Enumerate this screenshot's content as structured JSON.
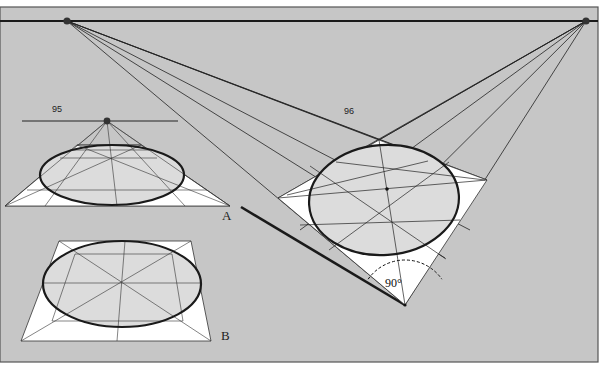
{
  "colors": {
    "background": "#c6c6c6",
    "frame": "#555555",
    "ink": "#1a1a1a",
    "plane_fill": "#ffffff",
    "ellipse_fill": "#dcdcdc",
    "thin_line": "#333333"
  },
  "frame": {
    "x": 0,
    "y": 7,
    "w": 598,
    "h": 355
  },
  "horizon": {
    "y": 21,
    "x1": 0,
    "x2": 598
  },
  "vanishing_points": [
    {
      "id": "vp-left",
      "x": 67,
      "y": 21
    },
    {
      "id": "vp-right",
      "x": 586,
      "y": 21
    }
  ],
  "labels": {
    "fig95": {
      "text": "95",
      "x": 52,
      "y": 112
    },
    "fig96": {
      "text": "96",
      "x": 344,
      "y": 114
    },
    "A": {
      "text": "A",
      "x": 222,
      "y": 220
    },
    "B": {
      "text": "B",
      "x": 221,
      "y": 340
    },
    "angle": {
      "text": "90°",
      "x": 385,
      "y": 287
    }
  },
  "figure_a": {
    "horizon": {
      "x1": 22,
      "x2": 178,
      "y": 121
    },
    "vp": {
      "x": 107,
      "y": 121
    },
    "triangle": [
      [
        5,
        206
      ],
      [
        230,
        206
      ],
      [
        107,
        121
      ]
    ],
    "trap": [
      [
        77,
        145
      ],
      [
        141,
        145
      ],
      [
        230,
        206
      ],
      [
        5,
        206
      ]
    ],
    "ellipse": {
      "cx": 112,
      "cy": 175,
      "rx": 72,
      "ry": 30
    },
    "lines": [
      [
        [
          107,
          121
        ],
        [
          117,
          206
        ]
      ],
      [
        [
          107,
          121
        ],
        [
          45,
          206
        ]
      ],
      [
        [
          107,
          121
        ],
        [
          185,
          206
        ]
      ],
      [
        [
          107,
          121
        ],
        [
          5,
          206
        ]
      ],
      [
        [
          107,
          121
        ],
        [
          230,
          206
        ]
      ],
      [
        [
          77,
          145
        ],
        [
          230,
          206
        ]
      ],
      [
        [
          141,
          145
        ],
        [
          5,
          206
        ]
      ],
      [
        [
          77,
          145
        ],
        [
          141,
          145
        ]
      ],
      [
        [
          60,
          158
        ],
        [
          157,
          158
        ]
      ],
      [
        [
          27,
          190
        ],
        [
          207,
          190
        ]
      ],
      [
        [
          70,
          150
        ],
        [
          149,
          150
        ]
      ]
    ]
  },
  "figure_b": {
    "trap": [
      [
        59,
        241
      ],
      [
        191,
        241
      ],
      [
        211,
        341
      ],
      [
        21,
        341
      ]
    ],
    "ellipse": {
      "cx": 122,
      "cy": 284,
      "rx": 79,
      "ry": 43
    },
    "lines": [
      [
        [
          59,
          241
        ],
        [
          211,
          341
        ]
      ],
      [
        [
          191,
          241
        ],
        [
          21,
          341
        ]
      ],
      [
        [
          125,
          241
        ],
        [
          117,
          341
        ]
      ],
      [
        [
          42,
          283
        ],
        [
          201,
          283
        ]
      ],
      [
        [
          75,
          254
        ],
        [
          172,
          254
        ]
      ],
      [
        [
          52,
          321
        ],
        [
          183,
          321
        ]
      ],
      [
        [
          75,
          254
        ],
        [
          52,
          321
        ]
      ],
      [
        [
          172,
          254
        ],
        [
          183,
          321
        ]
      ]
    ]
  },
  "figure_96": {
    "quad": [
      [
        379,
        140
      ],
      [
        487,
        180
      ],
      [
        405,
        305
      ],
      [
        278,
        198
      ]
    ],
    "ellipse": {
      "cx": 384,
      "cy": 200,
      "rx": 75,
      "ry": 55,
      "rotate": -4
    },
    "center": [
      387,
      189
    ],
    "lines": [
      [
        [
          278,
          198
        ],
        [
          487,
          180
        ]
      ],
      [
        [
          379,
          140
        ],
        [
          405,
          305
        ]
      ],
      [
        [
          310,
          166
        ],
        [
          446,
          259
        ]
      ],
      [
        [
          449,
          162
        ],
        [
          329,
          250
        ]
      ],
      [
        [
          336,
          162
        ],
        [
          485,
          180
        ]
      ],
      [
        [
          287,
          195
        ],
        [
          428,
          161
        ]
      ],
      [
        [
          300,
          225
        ],
        [
          460,
          220
        ]
      ]
    ],
    "converging_left": [
      [
        [
          67,
          21
        ],
        [
          379,
          140
        ]
      ],
      [
        [
          67,
          21
        ],
        [
          487,
          180
        ]
      ],
      [
        [
          67,
          21
        ],
        [
          433,
          160
        ]
      ],
      [
        [
          67,
          21
        ],
        [
          470,
          230
        ]
      ],
      [
        [
          67,
          21
        ],
        [
          445,
          258
        ]
      ],
      [
        [
          67,
          21
        ],
        [
          405,
          305
        ]
      ]
    ],
    "converging_right": [
      [
        [
          586,
          21
        ],
        [
          379,
          140
        ]
      ],
      [
        [
          586,
          21
        ],
        [
          278,
          198
        ]
      ],
      [
        [
          586,
          21
        ],
        [
          330,
          167
        ]
      ],
      [
        [
          586,
          21
        ],
        [
          300,
          230
        ]
      ],
      [
        [
          586,
          21
        ],
        [
          355,
          251
        ]
      ],
      [
        [
          586,
          21
        ],
        [
          405,
          305
        ]
      ]
    ],
    "thick_line": [
      [
        241,
        207
      ],
      [
        405,
        305
      ]
    ],
    "angle_arc": {
      "cx": 405,
      "cy": 305,
      "r": 45,
      "start": 215,
      "end": 325
    }
  }
}
